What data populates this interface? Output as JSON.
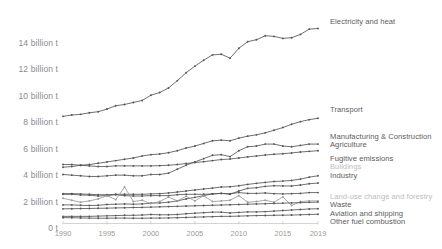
{
  "chart_data": {
    "type": "line",
    "title": "",
    "subtitle": "",
    "xlabel": "",
    "ylabel": "",
    "grid": false,
    "legend_position": "right-inline",
    "xlim": [
      1990,
      2019
    ],
    "ylim": [
      0,
      15.2
    ],
    "y_unit": "billion t",
    "x_ticks": [
      1990,
      1995,
      2000,
      2005,
      2010,
      2015,
      2019
    ],
    "x_tick_labels": [
      "1990",
      "1995",
      "2000",
      "2005",
      "2010",
      "2015",
      "2019"
    ],
    "y_ticks": [
      0,
      2,
      4,
      6,
      8,
      10,
      12,
      14
    ],
    "y_tick_labels": [
      "0 t",
      "2 billion t",
      "4 billion t",
      "6 billion t",
      "8 billion t",
      "10 billion t",
      "12 billion t",
      "14 billion t"
    ],
    "x": [
      1990,
      1991,
      1992,
      1993,
      1994,
      1995,
      1996,
      1997,
      1998,
      1999,
      2000,
      2001,
      2002,
      2003,
      2004,
      2005,
      2006,
      2007,
      2008,
      2009,
      2010,
      2011,
      2012,
      2013,
      2014,
      2015,
      2016,
      2017,
      2018,
      2019
    ],
    "series": [
      {
        "name": "Electricity and heat",
        "label": "Electricity and heat",
        "label_style": "strong",
        "color": "#555555",
        "values": [
          8.45,
          8.55,
          8.6,
          8.72,
          8.8,
          9.0,
          9.25,
          9.35,
          9.5,
          9.65,
          10.05,
          10.25,
          10.6,
          11.15,
          11.75,
          12.25,
          12.7,
          13.1,
          13.15,
          12.85,
          13.6,
          14.1,
          14.25,
          14.55,
          14.5,
          14.35,
          14.4,
          14.65,
          15.05,
          15.1
        ]
      },
      {
        "name": "Transport",
        "label": "Transport",
        "label_style": "strong",
        "color": "#555555",
        "values": [
          4.6,
          4.65,
          4.75,
          4.8,
          4.9,
          5.0,
          5.1,
          5.2,
          5.3,
          5.45,
          5.55,
          5.6,
          5.7,
          5.85,
          6.05,
          6.2,
          6.4,
          6.6,
          6.65,
          6.6,
          6.8,
          6.95,
          7.05,
          7.2,
          7.4,
          7.6,
          7.85,
          8.05,
          8.2,
          8.3
        ]
      },
      {
        "name": "Manufacturing & Construction",
        "label": "Manufacturing & Construction",
        "label_style": "strong",
        "color": "#555555",
        "values": [
          4.05,
          4.0,
          3.95,
          3.9,
          3.9,
          3.95,
          4.0,
          4.0,
          3.95,
          3.95,
          4.05,
          4.05,
          4.15,
          4.45,
          4.75,
          5.0,
          5.25,
          5.5,
          5.55,
          5.4,
          5.85,
          6.15,
          6.2,
          6.35,
          6.35,
          6.2,
          6.15,
          6.25,
          6.35,
          6.35
        ]
      },
      {
        "name": "Agriculture",
        "label": "Agriculture",
        "label_style": "strong",
        "color": "#555555",
        "values": [
          4.8,
          4.8,
          4.75,
          4.7,
          4.65,
          4.65,
          4.7,
          4.7,
          4.7,
          4.7,
          4.7,
          4.72,
          4.75,
          4.8,
          4.88,
          4.95,
          5.02,
          5.1,
          5.18,
          5.22,
          5.3,
          5.38,
          5.45,
          5.52,
          5.58,
          5.62,
          5.68,
          5.75,
          5.8,
          5.85
        ]
      },
      {
        "name": "Fugitive emissions",
        "label": "Fugitive emissions",
        "label_style": "strong",
        "color": "#555555",
        "values": [
          2.6,
          2.6,
          2.58,
          2.55,
          2.52,
          2.52,
          2.55,
          2.55,
          2.55,
          2.55,
          2.58,
          2.6,
          2.65,
          2.72,
          2.8,
          2.88,
          2.95,
          3.02,
          3.1,
          3.12,
          3.2,
          3.3,
          3.38,
          3.45,
          3.52,
          3.55,
          3.6,
          3.7,
          3.85,
          3.95
        ]
      },
      {
        "name": "Buildings",
        "label": "Buildings",
        "label_style": "faint",
        "color": "#555555",
        "values": [
          2.55,
          2.55,
          2.5,
          2.48,
          2.42,
          2.45,
          2.52,
          2.45,
          2.42,
          2.42,
          2.45,
          2.45,
          2.45,
          2.52,
          2.55,
          2.55,
          2.55,
          2.58,
          2.62,
          2.6,
          2.68,
          2.62,
          2.62,
          2.65,
          2.6,
          2.58,
          2.6,
          2.62,
          2.68,
          2.68
        ]
      },
      {
        "name": "Industry",
        "label": "Industry",
        "label_style": "strong",
        "color": "#555555",
        "values": [
          1.75,
          1.75,
          1.72,
          1.7,
          1.72,
          1.78,
          1.8,
          1.82,
          1.8,
          1.82,
          1.88,
          1.9,
          1.95,
          2.05,
          2.2,
          2.32,
          2.45,
          2.58,
          2.62,
          2.55,
          2.8,
          3.0,
          3.05,
          3.15,
          3.2,
          3.18,
          3.18,
          3.25,
          3.35,
          3.4
        ]
      },
      {
        "name": "Land-use change and forestry",
        "label": "Land-use change and forestry",
        "label_style": "faint",
        "color": "#999999",
        "values": [
          2.25,
          2.1,
          1.95,
          2.05,
          2.2,
          2.45,
          2.15,
          3.1,
          2.0,
          2.1,
          1.85,
          2.0,
          2.35,
          2.05,
          2.4,
          2.05,
          2.45,
          2.0,
          2.05,
          2.1,
          2.45,
          1.95,
          2.0,
          2.1,
          1.95,
          2.35,
          1.7,
          2.0,
          2.05,
          2.05
        ]
      },
      {
        "name": "Waste",
        "label": "Waste",
        "label_style": "strong",
        "color": "#555555",
        "values": [
          1.45,
          1.46,
          1.47,
          1.48,
          1.49,
          1.5,
          1.52,
          1.53,
          1.55,
          1.56,
          1.58,
          1.6,
          1.62,
          1.64,
          1.66,
          1.68,
          1.7,
          1.72,
          1.74,
          1.76,
          1.78,
          1.8,
          1.82,
          1.84,
          1.86,
          1.88,
          1.9,
          1.92,
          1.94,
          1.96
        ]
      },
      {
        "name": "Aviation and shipping",
        "label": "Aviation and shipping",
        "label_style": "strong",
        "color": "#555555",
        "values": [
          0.88,
          0.88,
          0.88,
          0.88,
          0.9,
          0.92,
          0.94,
          0.96,
          0.96,
          0.98,
          1.02,
          1.0,
          1.0,
          1.02,
          1.08,
          1.12,
          1.16,
          1.2,
          1.2,
          1.14,
          1.18,
          1.22,
          1.22,
          1.24,
          1.28,
          1.32,
          1.36,
          1.4,
          1.44,
          1.46
        ]
      },
      {
        "name": "Other fuel combustion",
        "label": "Other fuel combustion",
        "label_style": "strong",
        "color": "#555555",
        "values": [
          0.78,
          0.78,
          0.76,
          0.75,
          0.74,
          0.74,
          0.75,
          0.75,
          0.74,
          0.74,
          0.75,
          0.75,
          0.76,
          0.78,
          0.8,
          0.82,
          0.84,
          0.86,
          0.88,
          0.88,
          0.9,
          0.92,
          0.94,
          0.95,
          0.96,
          0.97,
          0.98,
          1.0,
          1.02,
          1.04
        ]
      }
    ]
  }
}
